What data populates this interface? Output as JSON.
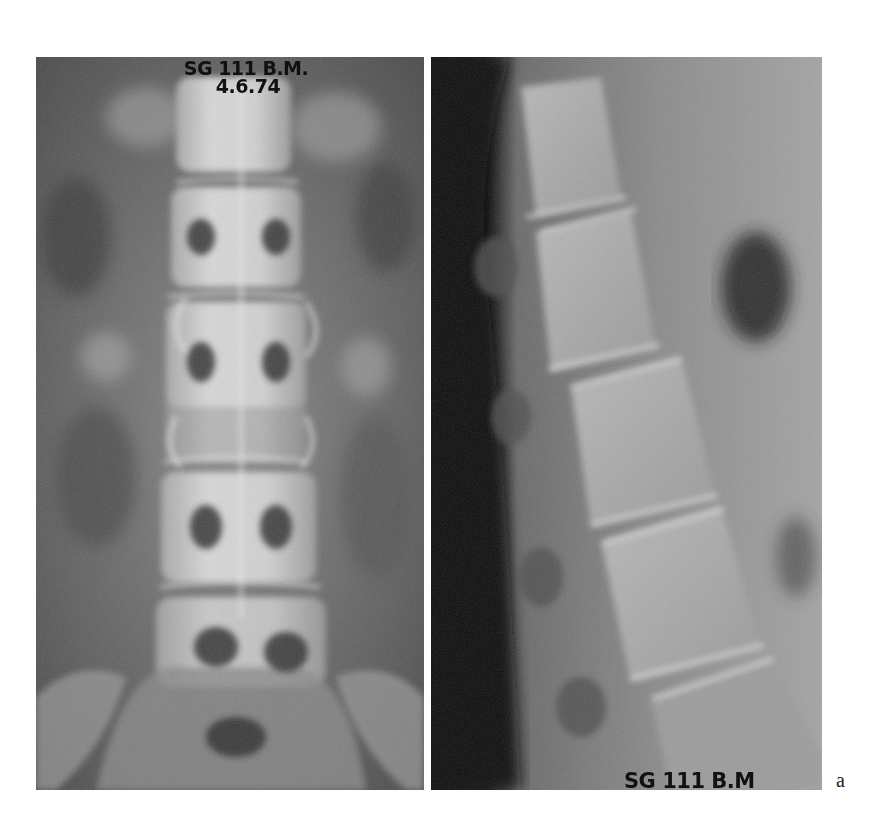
{
  "figure": {
    "panels": [
      {
        "id": "ap",
        "view": "anteroposterior lumbar spine radiograph",
        "label_line1": "SG 111 B.M.",
        "label_line2": "4.6.74"
      },
      {
        "id": "lateral",
        "view": "lateral lumbar spine radiograph",
        "label": "SG 111 B.M"
      }
    ],
    "figure_letter": "a",
    "colors": {
      "background": "#ffffff",
      "film_mid": "#6e6e6e",
      "bone_highlight": "#e6e6e6",
      "soft_shadow": "#2a2a2a",
      "label_text": "#111111"
    }
  }
}
